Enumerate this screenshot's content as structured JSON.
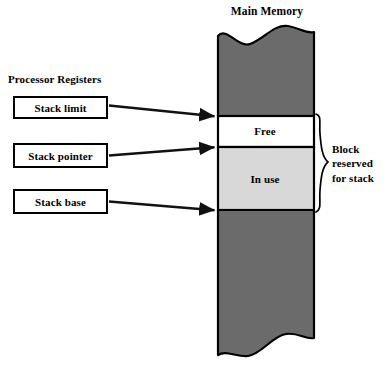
{
  "diagram": {
    "title": "Main Memory",
    "processor_registers_heading": "Processor Registers",
    "registers": [
      {
        "id": "stack-limit",
        "label": "Stack limit"
      },
      {
        "id": "stack-pointer",
        "label": "Stack pointer"
      },
      {
        "id": "stack-base",
        "label": "Stack base"
      }
    ],
    "memory_regions": [
      {
        "id": "free",
        "label": "Free",
        "fill": "#ffffff"
      },
      {
        "id": "in-use",
        "label": "In use",
        "fill": "#d8d8d8"
      }
    ],
    "memory_fill": "#6b6b6b",
    "stroke": "#000000",
    "brace_caption": {
      "line1": "Block",
      "line2": "reserved",
      "line3": "for stack"
    }
  }
}
